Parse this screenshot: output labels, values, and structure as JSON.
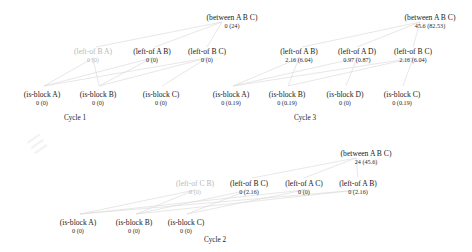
{
  "diagram": {
    "title": "",
    "edge_color": "#dcdcdc",
    "node_text_color": "#1a1a1a",
    "dim_text_color": "#b9b9b9",
    "background": "#ffffff"
  },
  "cycles": [
    {
      "id": "cycle-1",
      "label": "Cycle 1",
      "label_x": 75,
      "label_y": 114,
      "nodes": [
        {
          "name": "between-a-b-c",
          "label": "(between A B C)",
          "value": "0 (24)",
          "x": 232,
          "y": 14,
          "dim": false
        },
        {
          "name": "left-of-b-a",
          "label": "(left-of B A)",
          "value": "0 (0)",
          "x": 93,
          "y": 48,
          "dim": true
        },
        {
          "name": "left-of-a-b",
          "label": "(left-of A B)",
          "value": "0 (0)",
          "x": 152,
          "y": 48,
          "dim": false
        },
        {
          "name": "left-of-b-c",
          "label": "(left-of B C)",
          "value": "0 (0)",
          "x": 207,
          "y": 48,
          "dim": false
        },
        {
          "name": "is-block-a",
          "label": "(is-block A)",
          "value": "0 (0)",
          "x": 42,
          "y": 91,
          "dim": false
        },
        {
          "name": "is-block-b",
          "label": "(is-block B)",
          "value": "0 (0)",
          "x": 98,
          "y": 91,
          "dim": false
        },
        {
          "name": "is-block-c",
          "label": "(is-block C)",
          "value": "0 (0)",
          "x": 161,
          "y": 91,
          "dim": false
        }
      ]
    },
    {
      "id": "cycle-3",
      "label": "Cycle 3",
      "label_x": 305,
      "label_y": 114,
      "nodes": [
        {
          "name": "between-a-b-c",
          "label": "(between A B C)",
          "value": "45.6 (82.53)",
          "x": 430,
          "y": 14,
          "dim": false
        },
        {
          "name": "left-of-a-b",
          "label": "(left-of A B)",
          "value": "2.16 (6.04)",
          "x": 299,
          "y": 48,
          "dim": false
        },
        {
          "name": "left-of-a-d",
          "label": "(left-of A D)",
          "value": "0.97 (0.87)",
          "x": 357,
          "y": 48,
          "dim": false
        },
        {
          "name": "left-of-b-c",
          "label": "(left-of B C)",
          "value": "2.16 (6.04)",
          "x": 413,
          "y": 48,
          "dim": false
        },
        {
          "name": "is-block-a",
          "label": "(is-block A)",
          "value": "0 (0.19)",
          "x": 231,
          "y": 91,
          "dim": false
        },
        {
          "name": "is-block-b",
          "label": "(is-block B)",
          "value": "0 (0.19)",
          "x": 287,
          "y": 91,
          "dim": false
        },
        {
          "name": "is-block-d",
          "label": "(is-block D)",
          "value": "0 (0)",
          "x": 345,
          "y": 91,
          "dim": false
        },
        {
          "name": "is-block-c",
          "label": "(is-block C)",
          "value": "0 (0.19)",
          "x": 402,
          "y": 91,
          "dim": false
        }
      ]
    },
    {
      "id": "cycle-2",
      "label": "Cycle 2",
      "label_x": 215,
      "label_y": 236,
      "nodes": [
        {
          "name": "between-a-b-c",
          "label": "(between A B C)",
          "value": "24 (45.6)",
          "x": 366,
          "y": 150,
          "dim": false
        },
        {
          "name": "left-of-c-b",
          "label": "(left-of C B)",
          "value": "0 (0)",
          "x": 195,
          "y": 180,
          "dim": true
        },
        {
          "name": "left-of-b-c",
          "label": "(left-of B C)",
          "value": "0 (2.16)",
          "x": 249,
          "y": 180,
          "dim": false
        },
        {
          "name": "left-of-a-c",
          "label": "(left-of A C)",
          "value": "0 (0)",
          "x": 304,
          "y": 180,
          "dim": false
        },
        {
          "name": "left-of-a-b",
          "label": "(left-of A B)",
          "value": "0 (2.16)",
          "x": 358,
          "y": 180,
          "dim": false
        },
        {
          "name": "is-block-a",
          "label": "(is-block A)",
          "value": "0 (0)",
          "x": 78,
          "y": 219,
          "dim": false
        },
        {
          "name": "is-block-b",
          "label": "(is-block B)",
          "value": "0 (0)",
          "x": 134,
          "y": 219,
          "dim": false
        },
        {
          "name": "is-block-c",
          "label": "(is-block C)",
          "value": "0 (0)",
          "x": 186,
          "y": 219,
          "dim": false
        }
      ]
    }
  ],
  "edges": [
    {
      "from": "c1-between",
      "x1": 222,
      "y1": 22,
      "x2": 155,
      "y2": 47
    },
    {
      "from": "c1-between",
      "x1": 222,
      "y1": 22,
      "x2": 96,
      "y2": 47
    },
    {
      "from": "c1-between",
      "x1": 222,
      "y1": 22,
      "x2": 207,
      "y2": 47
    },
    {
      "from": "c1-lab",
      "x1": 152,
      "y1": 58,
      "x2": 44,
      "y2": 86
    },
    {
      "from": "c1-lab",
      "x1": 152,
      "y1": 58,
      "x2": 99,
      "y2": 86
    },
    {
      "from": "c1-lba",
      "x1": 93,
      "y1": 58,
      "x2": 44,
      "y2": 86
    },
    {
      "from": "c1-lba",
      "x1": 93,
      "y1": 58,
      "x2": 99,
      "y2": 86
    },
    {
      "from": "c1-lbc",
      "x1": 207,
      "y1": 58,
      "x2": 99,
      "y2": 86
    },
    {
      "from": "c1-lbc",
      "x1": 207,
      "y1": 58,
      "x2": 162,
      "y2": 86
    },
    {
      "from": "c1-lbc",
      "x1": 207,
      "y1": 58,
      "x2": 44,
      "y2": 86
    },
    {
      "from": "c3-between",
      "x1": 420,
      "y1": 22,
      "x2": 302,
      "y2": 47
    },
    {
      "from": "c3-between",
      "x1": 420,
      "y1": 22,
      "x2": 357,
      "y2": 47
    },
    {
      "from": "c3-between",
      "x1": 420,
      "y1": 22,
      "x2": 413,
      "y2": 47
    },
    {
      "from": "c3-lab",
      "x1": 299,
      "y1": 58,
      "x2": 233,
      "y2": 86
    },
    {
      "from": "c3-lab",
      "x1": 299,
      "y1": 58,
      "x2": 288,
      "y2": 86
    },
    {
      "from": "c3-lad",
      "x1": 357,
      "y1": 58,
      "x2": 233,
      "y2": 86
    },
    {
      "from": "c3-lad",
      "x1": 357,
      "y1": 58,
      "x2": 346,
      "y2": 86
    },
    {
      "from": "c3-lbc",
      "x1": 413,
      "y1": 58,
      "x2": 288,
      "y2": 86
    },
    {
      "from": "c3-lbc",
      "x1": 413,
      "y1": 58,
      "x2": 403,
      "y2": 86
    },
    {
      "from": "c3-lbc",
      "x1": 413,
      "y1": 58,
      "x2": 233,
      "y2": 86
    },
    {
      "from": "c2-between",
      "x1": 356,
      "y1": 158,
      "x2": 252,
      "y2": 178
    },
    {
      "from": "c2-between",
      "x1": 356,
      "y1": 158,
      "x2": 304,
      "y2": 178
    },
    {
      "from": "c2-between",
      "x1": 356,
      "y1": 158,
      "x2": 358,
      "y2": 178
    },
    {
      "from": "c2-lcb",
      "x1": 195,
      "y1": 190,
      "x2": 80,
      "y2": 214
    },
    {
      "from": "c2-lcb",
      "x1": 195,
      "y1": 190,
      "x2": 136,
      "y2": 214
    },
    {
      "from": "c2-lbc",
      "x1": 249,
      "y1": 190,
      "x2": 136,
      "y2": 214
    },
    {
      "from": "c2-lbc",
      "x1": 249,
      "y1": 190,
      "x2": 187,
      "y2": 214
    },
    {
      "from": "c2-lac",
      "x1": 304,
      "y1": 190,
      "x2": 80,
      "y2": 214
    },
    {
      "from": "c2-lac",
      "x1": 304,
      "y1": 190,
      "x2": 187,
      "y2": 214
    },
    {
      "from": "c2-lab",
      "x1": 358,
      "y1": 190,
      "x2": 80,
      "y2": 214
    },
    {
      "from": "c2-lab",
      "x1": 358,
      "y1": 190,
      "x2": 136,
      "y2": 214
    }
  ]
}
